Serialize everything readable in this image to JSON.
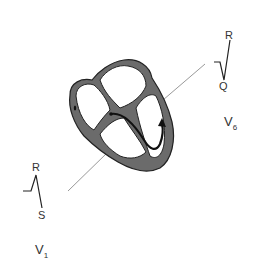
{
  "diagram": {
    "leads": [
      {
        "name": "V",
        "subscript": "1",
        "waves": {
          "top": "R",
          "bottom": "S"
        }
      },
      {
        "name": "V",
        "subscript": "6",
        "waves": {
          "top": "R",
          "bottom": "Q"
        }
      }
    ],
    "colors": {
      "heart_wall": "#6b6b6b",
      "outline": "#222222",
      "grid": "#888888",
      "line": "#999999"
    }
  }
}
